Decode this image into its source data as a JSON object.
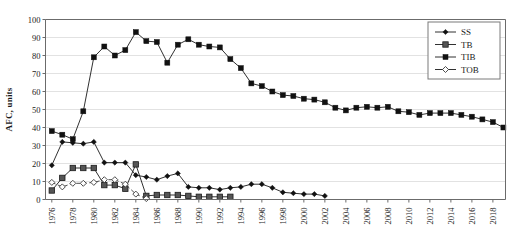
{
  "chart_data": {
    "type": "line",
    "title": "",
    "xlabel": "",
    "ylabel": "AFC, units",
    "ylim": [
      0,
      100
    ],
    "xlim": [
      1975.4,
      2019.2
    ],
    "ytick_values": [
      0,
      10,
      20,
      30,
      40,
      50,
      60,
      70,
      80,
      90,
      100
    ],
    "xtick_values": [
      1976,
      1978,
      1980,
      1982,
      1984,
      1986,
      1988,
      1990,
      1992,
      1994,
      1996,
      1998,
      2000,
      2002,
      2004,
      2006,
      2008,
      2010,
      2012,
      2014,
      2016,
      2018
    ],
    "xtick_labels": [
      "1976",
      "1978",
      "1980",
      "1982",
      "1984",
      "1986",
      "1988",
      "1990",
      "1992",
      "1994",
      "1996",
      "1998",
      "2000",
      "2002",
      "2004",
      "2006",
      "2008",
      "2010",
      "2012",
      "2014",
      "2016",
      "2018"
    ],
    "grid": "horizontal",
    "legend_position": "top-right",
    "series": [
      {
        "name": "SS",
        "marker": "filled-diamond",
        "line_style": "solid",
        "color": "#1a1a1a",
        "x": [
          1976,
          1977,
          1978,
          1979,
          1980,
          1981,
          1982,
          1983,
          1984,
          1985,
          1986,
          1987,
          1988,
          1989,
          1990,
          1991,
          1992,
          1993,
          1994,
          1995,
          1996,
          1997,
          1998,
          1999,
          2000,
          2001,
          2002
        ],
        "values": [
          19,
          32,
          31.5,
          31,
          32,
          20.5,
          20.5,
          20.5,
          13.5,
          12.5,
          11,
          13,
          14.5,
          7,
          6.5,
          6.5,
          5.5,
          6.5,
          7,
          8.5,
          8.5,
          6.5,
          4,
          3.5,
          3,
          3,
          2
        ]
      },
      {
        "name": "TB",
        "marker": "filled-square-gray",
        "line_style": "solid",
        "color": "#3a3a3a",
        "x": [
          1976,
          1977,
          1978,
          1979,
          1980,
          1981,
          1982,
          1983,
          1984,
          1985,
          1986,
          1987,
          1988,
          1989,
          1990,
          1991,
          1992,
          1993
        ],
        "values": [
          5,
          12,
          17.5,
          17.5,
          17.5,
          8,
          8,
          6,
          19.5,
          2,
          2.5,
          2.5,
          2.5,
          2,
          1.5,
          1.5,
          1.5,
          1.5
        ]
      },
      {
        "name": "TIB",
        "marker": "filled-square",
        "line_style": "solid",
        "color": "#111111",
        "x": [
          1976,
          1977,
          1978,
          1979,
          1980,
          1981,
          1982,
          1983,
          1984,
          1985,
          1986,
          1987,
          1988,
          1989,
          1990,
          1991,
          1992,
          1993,
          1994,
          1995,
          1996,
          1997,
          1998,
          1999,
          2000,
          2001,
          2002,
          2003,
          2004,
          2005,
          2006,
          2007,
          2008,
          2009,
          2010,
          2011,
          2012,
          2013,
          2014,
          2015,
          2016,
          2017,
          2018,
          2019
        ],
        "values": [
          38,
          36,
          33.5,
          49,
          79,
          85,
          80,
          83,
          93,
          88,
          87.5,
          76,
          86,
          89,
          86,
          85,
          84.5,
          78,
          73,
          64.5,
          63,
          60,
          58,
          57.5,
          56,
          55.5,
          54,
          51,
          49.5,
          51,
          51.5,
          51,
          51.5,
          49,
          48.5,
          47,
          48,
          48,
          48,
          47,
          46,
          44.5,
          43,
          40
        ]
      },
      {
        "name": "TOB",
        "marker": "open-diamond",
        "line_style": "dashed",
        "color": "#3a3a3a",
        "x": [
          1976,
          1977,
          1978,
          1979,
          1980,
          1981,
          1982,
          1983,
          1984,
          1985
        ],
        "values": [
          9.5,
          7,
          9,
          9,
          9.5,
          11,
          11,
          8.5,
          3,
          0.5
        ]
      }
    ],
    "legend_entries": [
      {
        "label": "SS",
        "marker": "filled-diamond",
        "line_style": "solid"
      },
      {
        "label": "TB",
        "marker": "filled-square-gray",
        "line_style": "solid"
      },
      {
        "label": "TIB",
        "marker": "filled-square",
        "line_style": "solid"
      },
      {
        "label": "TOB",
        "marker": "open-diamond",
        "line_style": "solid"
      }
    ]
  }
}
